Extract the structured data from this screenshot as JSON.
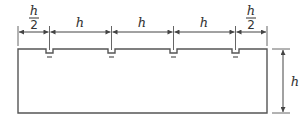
{
  "diagram": {
    "type": "dimensioned-drawing",
    "colors": {
      "line": "#555555",
      "text": "#333333",
      "background": "#ffffff"
    },
    "top_dimensions": [
      {
        "label_num": "h",
        "label_den": "2",
        "fraction": true
      },
      {
        "label": "h"
      },
      {
        "label": "h"
      },
      {
        "label": "h"
      },
      {
        "label_num": "h",
        "label_den": "2",
        "fraction": true
      }
    ],
    "side_dimension": {
      "label": "h"
    },
    "notch_count": 4
  }
}
